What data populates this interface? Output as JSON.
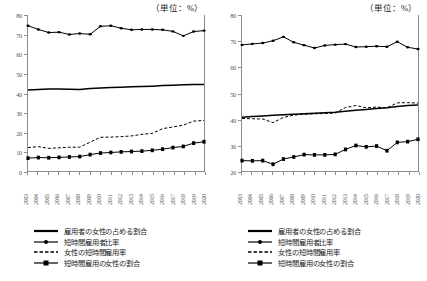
{
  "unit_note": "（単位：%）",
  "legend": [
    {
      "label": "雇用者の女性の占める割合",
      "style": "solid-thick"
    },
    {
      "label": "短時間雇用者比率",
      "style": "solid-dot"
    },
    {
      "label": "女性の短時間雇用率",
      "style": "dashed"
    },
    {
      "label": "短時間雇用の女性の割合",
      "style": "solid-square"
    }
  ],
  "chart_data": [
    {
      "type": "line",
      "panel": "left",
      "title": "",
      "xlabel": "",
      "ylabel": "",
      "unit": "（単位：%）",
      "grid": false,
      "legend_position": "bottom",
      "x": [
        2003,
        2004,
        2005,
        2006,
        2007,
        2008,
        2009,
        2010,
        2011,
        2012,
        2013,
        2014,
        2015,
        2016,
        2017,
        2018,
        2019,
        2020
      ],
      "xtick_labels": [
        "2003",
        "2004",
        "2005",
        "2006",
        "2007",
        "2008",
        "2009",
        "2010",
        "2011",
        "2012",
        "2013",
        "2014",
        "2015",
        "2016",
        "2017",
        "2018",
        "2019",
        "2020"
      ],
      "ylim": [
        0,
        80
      ],
      "ytick_labels": [
        "0",
        "10",
        "20",
        "30",
        "40",
        "50",
        "60",
        "70",
        "80"
      ],
      "series": [
        {
          "name": "雇用者の女性の占める割合",
          "style": "solid-thick",
          "marker": "none",
          "values": [
            41.5,
            41.8,
            42.0,
            42.0,
            41.9,
            41.8,
            42.3,
            42.6,
            42.8,
            43.0,
            43.2,
            43.3,
            43.5,
            43.8,
            44.0,
            44.2,
            44.4,
            44.4
          ]
        },
        {
          "name": "短時間雇用者比率",
          "style": "solid-dot",
          "marker": "circle",
          "values": [
            74.5,
            72.6,
            71.0,
            71.2,
            70.0,
            70.5,
            70.1,
            74.2,
            74.5,
            73.2,
            72.4,
            72.6,
            72.6,
            72.4,
            71.6,
            69.3,
            71.5,
            72.0
          ]
        },
        {
          "name": "女性の短時間雇用率",
          "style": "dashed",
          "marker": "none",
          "values": [
            12.0,
            12.5,
            11.6,
            11.9,
            12.2,
            12.2,
            14.8,
            17.3,
            17.4,
            17.6,
            18.0,
            18.8,
            19.3,
            21.7,
            22.6,
            23.5,
            25.6,
            25.9
          ]
        },
        {
          "name": "短時間雇用の女性の割合",
          "style": "solid-square",
          "marker": "square",
          "values": [
            6.6,
            6.9,
            6.8,
            7.0,
            7.2,
            7.4,
            8.4,
            9.2,
            9.5,
            9.8,
            10.0,
            10.2,
            10.6,
            11.2,
            12.0,
            12.6,
            14.3,
            15.0
          ]
        }
      ]
    },
    {
      "type": "line",
      "panel": "right",
      "title": "",
      "xlabel": "",
      "ylabel": "",
      "unit": "（単位：%）",
      "grid": false,
      "legend_position": "bottom",
      "x": [
        2003,
        2004,
        2005,
        2006,
        2007,
        2008,
        2009,
        2010,
        2011,
        2012,
        2013,
        2014,
        2015,
        2016,
        2017,
        2018,
        2019,
        2020
      ],
      "xtick_labels": [
        "2003",
        "2004",
        "2005",
        "2006",
        "2007",
        "2008",
        "2009",
        "2010",
        "2011",
        "2012",
        "2013",
        "2014",
        "2015",
        "2016",
        "2017",
        "2018",
        "2019",
        "2020"
      ],
      "ylim": [
        20,
        80
      ],
      "ytick_labels": [
        "20",
        "30",
        "40",
        "50",
        "60",
        "70",
        "80"
      ],
      "series": [
        {
          "name": "雇用者の女性の占める割合",
          "style": "solid-thick",
          "marker": "none",
          "values": [
            40.7,
            41.0,
            41.2,
            41.4,
            41.6,
            41.8,
            42.0,
            42.2,
            42.4,
            42.6,
            43.0,
            43.4,
            43.7,
            44.0,
            44.3,
            44.8,
            45.2,
            45.4
          ]
        },
        {
          "name": "短時間雇用者比率",
          "style": "solid-dot",
          "marker": "circle",
          "values": [
            68.5,
            68.9,
            69.2,
            70.1,
            71.6,
            69.5,
            68.4,
            67.3,
            68.3,
            68.6,
            68.8,
            67.7,
            67.8,
            68.0,
            67.8,
            69.7,
            67.6,
            66.9
          ]
        },
        {
          "name": "女性の短時間雇用率",
          "style": "dashed",
          "marker": "none",
          "values": [
            40.2,
            40.1,
            40.0,
            38.6,
            40.6,
            41.5,
            41.8,
            42.0,
            42.1,
            42.3,
            44.4,
            45.2,
            44.3,
            44.6,
            44.3,
            46.2,
            46.3,
            46.1
          ]
        },
        {
          "name": "短時間雇用の女性の割合",
          "style": "solid-square",
          "marker": "square",
          "values": [
            24.0,
            23.9,
            24.0,
            22.6,
            24.6,
            25.4,
            26.3,
            26.2,
            26.2,
            26.4,
            28.3,
            29.8,
            29.3,
            29.6,
            27.8,
            31.0,
            31.3,
            32.2
          ]
        }
      ]
    }
  ]
}
